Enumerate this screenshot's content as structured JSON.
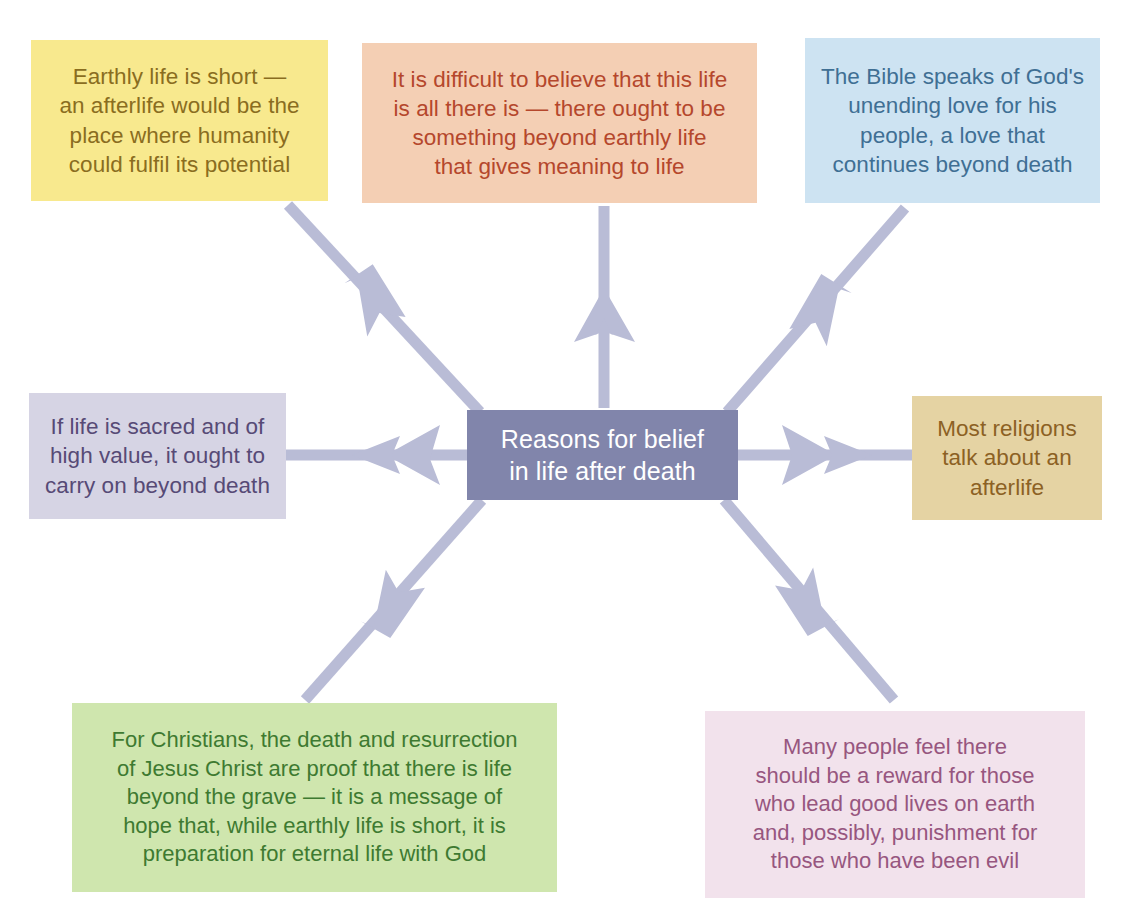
{
  "diagram": {
    "title": "Reasons for belief in life after death",
    "type": "radial-mind-map",
    "arrow_color": "#b9bcd6",
    "background": "#ffffff",
    "center": {
      "label": "Reasons for belief\nin life after death",
      "bg": "#8185ab",
      "text_color": "#ffffff"
    },
    "nodes": [
      {
        "id": "earthly-life-short",
        "label": "Earthly life is short —\nan afterlife would be the\nplace where humanity\ncould fulfil its potential",
        "bg": "#f8e98e",
        "text_color": "#8a6d1f",
        "position": "top-left"
      },
      {
        "id": "difficult-to-believe",
        "label": "It is difficult to believe that this life\nis all there is — there ought to be\nsomething beyond earthly life\nthat gives meaning to life",
        "bg": "#f4cfb4",
        "text_color": "#b5472c",
        "position": "top-center"
      },
      {
        "id": "bible-unending-love",
        "label": "The Bible speaks of God's\nunending love for his\npeople, a love that\ncontinues beyond death",
        "bg": "#cde3f2",
        "text_color": "#3f6f94",
        "position": "top-right"
      },
      {
        "id": "life-is-sacred",
        "label": "If life is sacred and of\nhigh value, it ought to\ncarry on beyond death",
        "bg": "#d6d4e4",
        "text_color": "#574a76",
        "position": "middle-left"
      },
      {
        "id": "most-religions",
        "label": "Most religions\ntalk about an\nafterlife",
        "bg": "#e5d3a3",
        "text_color": "#8c6124",
        "position": "middle-right"
      },
      {
        "id": "christians-resurrection",
        "label": "For Christians, the death and resurrection\nof Jesus Christ are proof that there is life\nbeyond the grave — it is a message of\nhope that, while earthly life is short, it is\npreparation for eternal life with God",
        "bg": "#cfe6ae",
        "text_color": "#3e7a31",
        "position": "bottom-left"
      },
      {
        "id": "reward-and-punishment",
        "label": "Many people feel there\nshould be a reward for those\nwho lead good lives on earth\nand, possibly, punishment for\nthose who have been evil",
        "bg": "#f2e2ec",
        "text_color": "#97567f",
        "position": "bottom-right"
      }
    ],
    "connectors": [
      {
        "id": "connector-to-earthly-life-short",
        "from": "center",
        "to": "earthly-life-short",
        "direction": "up-left"
      },
      {
        "id": "connector-to-difficult-to-believe",
        "from": "center",
        "to": "difficult-to-believe",
        "direction": "up"
      },
      {
        "id": "connector-to-bible-unending-love",
        "from": "center",
        "to": "bible-unending-love",
        "direction": "up-right"
      },
      {
        "id": "connector-to-life-is-sacred",
        "from": "center",
        "to": "life-is-sacred",
        "direction": "left"
      },
      {
        "id": "connector-to-most-religions",
        "from": "center",
        "to": "most-religions",
        "direction": "right"
      },
      {
        "id": "connector-to-christians-resurrection",
        "from": "center",
        "to": "christians-resurrection",
        "direction": "down-left"
      },
      {
        "id": "connector-to-reward-and-punishment",
        "from": "center",
        "to": "reward-and-punishment",
        "direction": "down-right"
      }
    ]
  }
}
